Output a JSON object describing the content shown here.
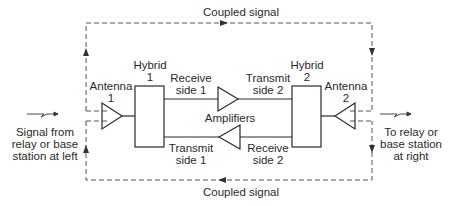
{
  "diagram": {
    "top_coupled_label": "Coupled signal",
    "bottom_coupled_label": "Coupled signal",
    "antenna1": {
      "label": "Antenna\n1"
    },
    "antenna2": {
      "label": "Antenna\n2"
    },
    "hybrid1": {
      "label": "Hybrid\n1"
    },
    "hybrid2": {
      "label": "Hybrid\n2"
    },
    "receive_side1": "Receive\nside 1",
    "transmit_side2": "Transmit\nside 2",
    "transmit_side1": "Transmit\nside 1",
    "receive_side2": "Receive\nside 2",
    "amplifiers": "Amplifiers",
    "left_signal": "Signal from\nrelay or base\nstation at left",
    "right_signal": "To relay or\nbase station\nat right",
    "colors": {
      "line": "#2a2a2a",
      "dashed": "#555555",
      "background": "#ffffff"
    }
  }
}
